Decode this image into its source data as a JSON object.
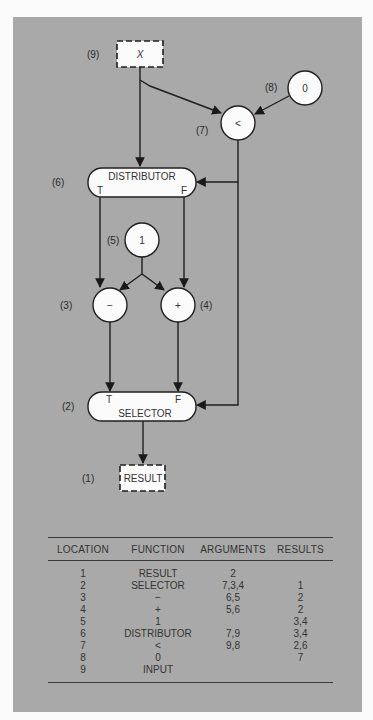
{
  "diagram": {
    "nodes": {
      "input": {
        "label": "(9)",
        "text": "X"
      },
      "zero": {
        "label": "(8)",
        "text": "0"
      },
      "less": {
        "label": "(7)",
        "text": "<"
      },
      "distributor": {
        "label": "(6)",
        "text": "DISTRIBUTOR",
        "port_t": "T",
        "port_f": "F"
      },
      "one": {
        "label": "(5)",
        "text": "1"
      },
      "minus": {
        "label": "(3)",
        "text": "−"
      },
      "plus": {
        "label": "(4)",
        "text": "+"
      },
      "selector": {
        "label": "(2)",
        "text": "SELECTOR",
        "port_t": "T",
        "port_f": "F"
      },
      "result": {
        "label": "(1)",
        "text": "RESULT"
      }
    }
  },
  "table": {
    "headers": [
      "LOCATION",
      "FUNCTION",
      "ARGUMENTS",
      "RESULTS"
    ],
    "rows": [
      [
        "1",
        "RESULT",
        "2",
        ""
      ],
      [
        "2",
        "SELECTOR",
        "7,3,4",
        "1"
      ],
      [
        "3",
        "−",
        "6,5",
        "2"
      ],
      [
        "4",
        "+",
        "5,6",
        "2"
      ],
      [
        "5",
        "1",
        "",
        "3,4"
      ],
      [
        "6",
        "DISTRIBUTOR",
        "7,9",
        "3,4"
      ],
      [
        "7",
        "<",
        "9,8",
        "2,6"
      ],
      [
        "8",
        "0",
        "",
        "7"
      ],
      [
        "9",
        "INPUT",
        "",
        ""
      ]
    ]
  }
}
